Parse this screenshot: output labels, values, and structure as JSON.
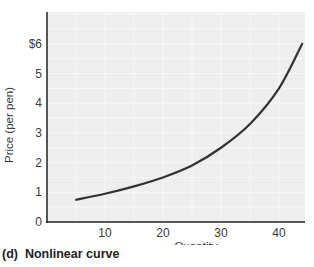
{
  "chart_data": {
    "type": "line",
    "title": "",
    "caption_label": "(d)",
    "caption_text": "Nonlinear curve",
    "xlabel": "Quantity",
    "ylabel": "Price (per pen)",
    "xlim": [
      0,
      45
    ],
    "ylim": [
      0,
      7
    ],
    "x_ticks": [
      10,
      20,
      30,
      40
    ],
    "x_tick_labels": [
      "10",
      "20",
      "30",
      "40"
    ],
    "y_ticks": [
      0,
      1,
      2,
      3,
      4,
      5,
      6
    ],
    "y_tick_labels": [
      "0",
      "1",
      "2",
      "3",
      "4",
      "5",
      "$6"
    ],
    "grid": true,
    "legend": null,
    "series": [
      {
        "name": "Nonlinear curve",
        "x": [
          5,
          10,
          15,
          20,
          25,
          30,
          35,
          40,
          44
        ],
        "y": [
          0.75,
          0.95,
          1.2,
          1.5,
          1.9,
          2.5,
          3.3,
          4.5,
          6.0
        ]
      }
    ],
    "colors": {
      "background": "#eeeeee",
      "curve": "#333333",
      "axis": "#222222",
      "grid": "#f8f8f8"
    }
  }
}
